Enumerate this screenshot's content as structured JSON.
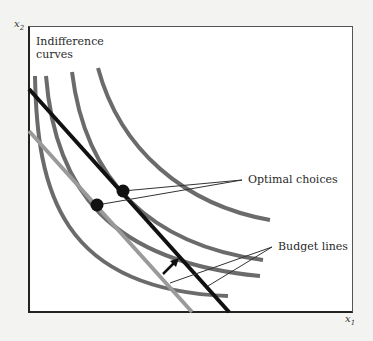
{
  "diagram": {
    "y_axis_label": "x",
    "y_axis_sub": "2",
    "x_axis_label": "x",
    "x_axis_sub": "1",
    "labels": {
      "indifference_line1": "Indifference",
      "indifference_line2": "curves",
      "optimal": "Optimal choices",
      "budget": "Budget lines"
    },
    "colors": {
      "indifference": "#6b6b6b",
      "new_budget": "#111111",
      "old_budget": "#9a9a9a",
      "frame": "#222222"
    }
  }
}
